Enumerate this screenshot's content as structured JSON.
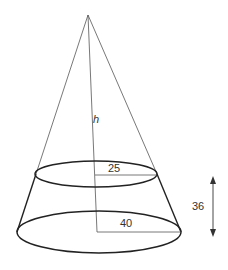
{
  "diagram": {
    "labels": {
      "height": "h",
      "top_radius": "25",
      "bottom_radius": "40",
      "frustum_height": "36"
    },
    "colors": {
      "stroke": "#222222",
      "thin_stroke": "#555555",
      "text": "#333333",
      "background": "#ffffff"
    }
  }
}
